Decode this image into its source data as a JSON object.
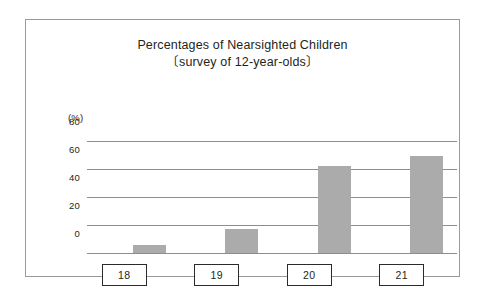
{
  "figure": {
    "frame_border_color": "#9a9a9a",
    "background_color": "#ffffff"
  },
  "chart_data": {
    "type": "bar",
    "title": "Percentages of Nearsighted Children",
    "subtitle": "〔survey of 12-year-olds〕",
    "xlabel": "",
    "ylabel": "",
    "unit_label": "(%)",
    "categories": [
      "18",
      "19",
      "20",
      "21"
    ],
    "values": [
      6,
      17,
      62,
      69
    ],
    "ylim": [
      0,
      80
    ],
    "yticks": [
      0,
      20,
      40,
      60,
      80
    ],
    "ytick_labels": [
      "0",
      "20",
      "40",
      "60",
      "80"
    ],
    "grid": true,
    "legend": "none",
    "bar_color": "#ababab",
    "gridline_color": "#8d8d8d",
    "series": [
      {
        "name": "Percentage of nearsighted children",
        "values": [
          6,
          17,
          62,
          69
        ]
      }
    ]
  }
}
